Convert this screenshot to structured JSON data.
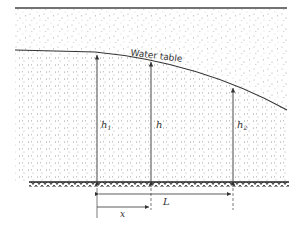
{
  "diagram": {
    "type": "groundwater-flow cross-section",
    "water_table_label": "Water table",
    "heads": [
      {
        "id": "h1",
        "label": "h",
        "sub": "1",
        "x": 97
      },
      {
        "id": "h",
        "label": "h",
        "sub": "",
        "x": 151
      },
      {
        "id": "h2",
        "label": "h",
        "sub": "2",
        "x": 233
      }
    ],
    "dimensions": {
      "L_label": "L",
      "x_label": "x"
    },
    "colors": {
      "line": "#333333",
      "stipple": "#9a9a9a",
      "background": "#ffffff"
    }
  }
}
